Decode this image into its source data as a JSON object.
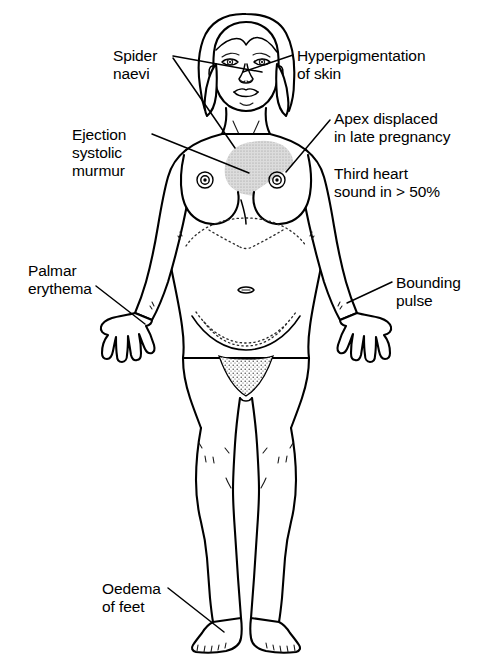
{
  "figure": {
    "background_color": "#ffffff",
    "line_color": "#000000",
    "shade_color": "#d9d9d9"
  },
  "annotations": [
    {
      "id": "spider-naevi",
      "lines": [
        "Spider",
        "naevi"
      ],
      "align": "left",
      "x": 113,
      "y": 47,
      "points_to": [
        "cheek",
        "upper chest"
      ]
    },
    {
      "id": "hyperpigmentation-of-skin",
      "lines": [
        "Hyperpigmentation",
        "of skin"
      ],
      "align": "left",
      "x": 297,
      "y": 47,
      "points_to": [
        "face"
      ]
    },
    {
      "id": "ejection-systolic-murmur",
      "lines": [
        "Ejection",
        "systolic",
        "murmur"
      ],
      "align": "left",
      "x": 72,
      "y": 126,
      "points_to": [
        "cardiac area"
      ]
    },
    {
      "id": "apex-displaced",
      "lines": [
        "Apex displaced",
        "in late pregnancy"
      ],
      "align": "left",
      "x": 334,
      "y": 110,
      "points_to": [
        "cardiac apex"
      ]
    },
    {
      "id": "third-heart-sound",
      "lines": [
        "Third heart",
        "sound in > 50%"
      ],
      "align": "left",
      "x": 334,
      "y": 165,
      "points_to": []
    },
    {
      "id": "palmar-erythema",
      "lines": [
        "Palmar",
        "erythema"
      ],
      "align": "left",
      "x": 28,
      "y": 262,
      "points_to": [
        "left palm"
      ]
    },
    {
      "id": "bounding-pulse",
      "lines": [
        "Bounding",
        "pulse"
      ],
      "align": "left",
      "x": 396,
      "y": 274,
      "points_to": [
        "right wrist"
      ]
    },
    {
      "id": "oedema-of-feet",
      "lines": [
        "Oedema",
        "of feet"
      ],
      "align": "left",
      "x": 102,
      "y": 580,
      "points_to": [
        "left ankle"
      ]
    }
  ]
}
